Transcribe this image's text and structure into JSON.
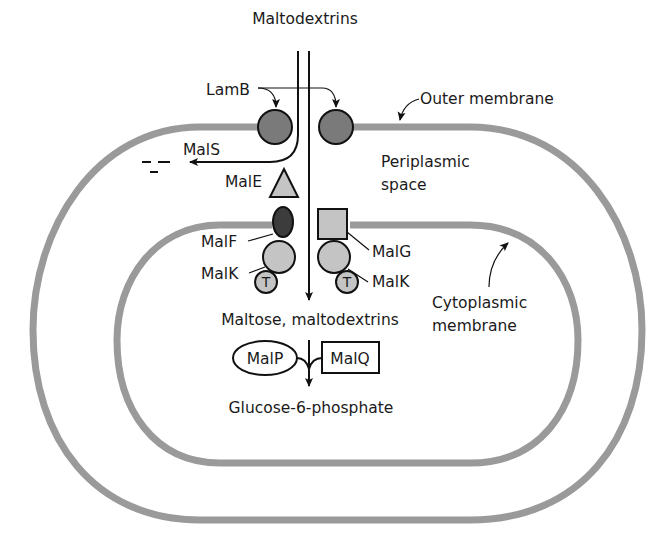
{
  "diagram": {
    "colors": {
      "membrane": "#9a9a9a",
      "lamb_fill": "#7a7a7a",
      "malf_fill": "#3c3c3c",
      "light_protein_fill": "#c4c4c4",
      "ink": "#111111"
    },
    "labels": {
      "top_substrate": "Maltodextrins",
      "lamb": "LamB",
      "outer_membrane": "Outer membrane",
      "mals": "MalS",
      "male": "MalE",
      "periplasm_line1": "Periplasmic",
      "periplasm_line2": "space",
      "malf": "MalF",
      "malg": "MalG",
      "malk_left": "MalK",
      "malk_right": "MalK",
      "t_left": "T",
      "t_right": "T",
      "cytoplasmic_line1": "Cytoplasmic",
      "cytoplasmic_line2": "membrane",
      "cytoplasm_substrate": "Maltose, maltodextrins",
      "malp": "MalP",
      "malq": "MalQ",
      "product": "Glucose-6-phosphate"
    }
  }
}
